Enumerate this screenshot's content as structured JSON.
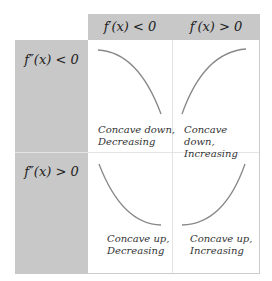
{
  "header": {
    "columns": [
      {
        "label": "f′(x) < 0"
      },
      {
        "label": "f′(x) > 0"
      }
    ]
  },
  "rows": [
    {
      "label": "f″(x) < 0",
      "cells": [
        {
          "caption_line1": "Concave down,",
          "caption_line2": "Decreasing",
          "curve": "concave-down-decreasing"
        },
        {
          "caption_line1": "Concave down,",
          "caption_line2": "Increasing",
          "curve": "concave-down-increasing"
        }
      ]
    },
    {
      "label": "f″(x) > 0",
      "cells": [
        {
          "caption_line1": "Concave up,",
          "caption_line2": "Decreasing",
          "curve": "concave-up-decreasing"
        },
        {
          "caption_line1": "Concave up,",
          "caption_line2": "Increasing",
          "curve": "concave-up-increasing"
        }
      ]
    }
  ],
  "colors": {
    "header_bg": "#c8c8c8",
    "curve": "#888888"
  }
}
